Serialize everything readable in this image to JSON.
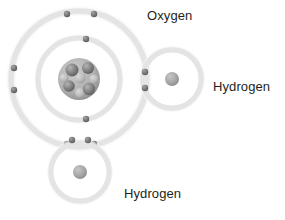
{
  "figure": {
    "background_color": "#ffffff",
    "width": 285,
    "height": 220
  },
  "labels": {
    "oxygen": "Oxygen",
    "hydrogen_right": "Hydrogen",
    "hydrogen_bottom": "Hydrogen",
    "text_color": "#231f20"
  },
  "colors": {
    "shell_ring": "#e8e8e8",
    "shell_ring_inner_glow": "#f4f4f4",
    "electron_fill": "#8a8a8a",
    "electron_stroke": "#6e6e6e",
    "hydrogen_nucleus": "#a9a9a9",
    "oxygen_nucleus_light": "#b9b9b9",
    "oxygen_nucleus_dark": "#7d7d7d"
  },
  "atoms": [
    {
      "id": "oxygen",
      "element": "O",
      "name": "Oxygen",
      "center": {
        "x": 79,
        "y": 79
      },
      "nucleus_radius": 21,
      "nucleus_type": "cluster",
      "shells": [
        {
          "index": 1,
          "radius": 41,
          "electron_count": 2
        },
        {
          "index": 2,
          "radius": 68,
          "electron_count": 6
        }
      ]
    },
    {
      "id": "hydrogen-right",
      "element": "H",
      "name": "Hydrogen",
      "center": {
        "x": 172,
        "y": 79
      },
      "nucleus_radius": 7,
      "nucleus_type": "single",
      "shells": [
        {
          "index": 1,
          "radius": 29,
          "electron_count": 2
        }
      ]
    },
    {
      "id": "hydrogen-bottom",
      "element": "H",
      "name": "Hydrogen",
      "center": {
        "x": 80,
        "y": 172
      },
      "nucleus_radius": 7,
      "nucleus_type": "single",
      "shells": [
        {
          "index": 1,
          "radius": 29,
          "electron_count": 2
        }
      ]
    }
  ],
  "electrons": {
    "radius": 3.2,
    "oxygen_inner": [
      {
        "x": 86,
        "y": 39
      },
      {
        "x": 86,
        "y": 119
      }
    ],
    "oxygen_outer": [
      {
        "x": 67,
        "y": 14
      },
      {
        "x": 94,
        "y": 14
      },
      {
        "x": 14,
        "y": 68
      },
      {
        "x": 14,
        "y": 90
      },
      {
        "x": 67,
        "y": 144
      },
      {
        "x": 94,
        "y": 144
      }
    ],
    "shared_pair_right": [
      {
        "x": 145,
        "y": 72
      },
      {
        "x": 145,
        "y": 88
      }
    ],
    "shared_pair_bottom": [
      {
        "x": 72,
        "y": 140
      },
      {
        "x": 88,
        "y": 140
      }
    ]
  },
  "nucleus_particles": {
    "oxygen": [
      {
        "x": 72,
        "y": 70,
        "r": 6.5,
        "shade": "dark"
      },
      {
        "x": 88,
        "y": 68,
        "r": 6.0,
        "shade": "dark"
      },
      {
        "x": 69,
        "y": 86,
        "r": 5.8,
        "shade": "dark"
      },
      {
        "x": 89,
        "y": 89,
        "r": 6.2,
        "shade": "dark"
      },
      {
        "x": 80,
        "y": 78,
        "r": 5.5,
        "shade": "light"
      },
      {
        "x": 80,
        "y": 93,
        "r": 5.0,
        "shade": "light"
      },
      {
        "x": 64,
        "y": 78,
        "r": 4.6,
        "shade": "light"
      },
      {
        "x": 94,
        "y": 79,
        "r": 4.6,
        "shade": "light"
      }
    ]
  }
}
